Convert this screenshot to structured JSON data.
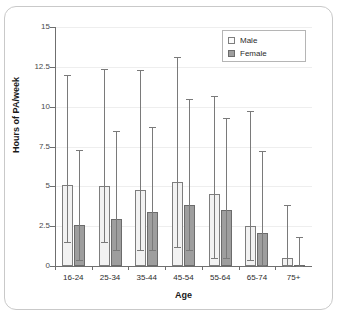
{
  "chart_data": {
    "type": "bar",
    "title": "",
    "xlabel": "Age",
    "ylabel": "Hours of PA/week",
    "categories": [
      "16-24",
      "25-34",
      "35-44",
      "45-54",
      "55-64",
      "65-74",
      "75+"
    ],
    "ylim": [
      0,
      15
    ],
    "yticks": [
      0,
      2.5,
      5,
      7.5,
      10,
      12.5,
      15
    ],
    "ytick_labels": [
      "0",
      "2.5",
      "5",
      "7.5",
      "10",
      "12.5",
      "15"
    ],
    "grid": true,
    "legend_position": "top-right",
    "series": [
      {
        "name": "Male",
        "color": "#f2f2f2",
        "edge_color": "#7d7d7d",
        "values": [
          5.1,
          5.0,
          4.75,
          5.25,
          4.55,
          2.5,
          0.5
        ],
        "error_low": [
          1.5,
          1.5,
          1.0,
          1.2,
          0.5,
          0.4,
          0.0
        ],
        "error_high": [
          12.0,
          12.35,
          12.3,
          13.1,
          10.7,
          9.7,
          3.8
        ]
      },
      {
        "name": "Female",
        "color": "#9e9e9e",
        "edge_color": "#6b6b6b",
        "values": [
          2.6,
          2.95,
          3.4,
          3.8,
          3.5,
          2.05,
          0.05
        ],
        "error_low": [
          0.4,
          1.0,
          1.0,
          1.0,
          0.5,
          0.05,
          0.0
        ],
        "error_high": [
          7.25,
          8.5,
          8.7,
          10.5,
          9.3,
          7.2,
          1.8
        ]
      }
    ]
  },
  "legend": {
    "items": [
      {
        "label": "Male"
      },
      {
        "label": "Female"
      }
    ]
  },
  "colors": {
    "male_fill": "#f2f2f2",
    "female_fill": "#9e9e9e",
    "axis": "#6f6f6f",
    "grid": "#eeeeee",
    "error": "#7a7a7a",
    "card_border": "#c9c9c9"
  }
}
